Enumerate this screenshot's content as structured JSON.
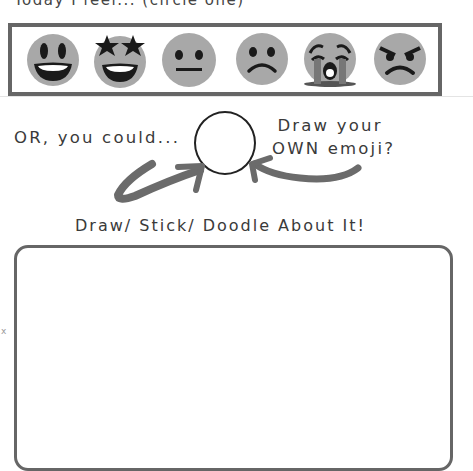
{
  "header": {
    "cut_off_text": "Today I feel... (circle one)"
  },
  "emoji_row": {
    "frame_color": "#666666",
    "face_color": "#a8a8a8",
    "feature_color": "#1a1a1a",
    "items": [
      {
        "name": "grinning-face",
        "label": "Happy"
      },
      {
        "name": "star-struck-face",
        "label": "Excited"
      },
      {
        "name": "neutral-face",
        "label": "Neutral"
      },
      {
        "name": "frowning-face",
        "label": "Sad"
      },
      {
        "name": "loudly-crying-face",
        "label": "Crying"
      },
      {
        "name": "angry-face",
        "label": "Angry"
      }
    ]
  },
  "own_emoji": {
    "or_text": "OR, you could...",
    "prompt_line1": "Draw your",
    "prompt_line2": "OWN emoji?"
  },
  "doodle": {
    "title": "Draw/ Stick/ Doodle About It!"
  },
  "margin_marks": {
    "left": "x"
  }
}
